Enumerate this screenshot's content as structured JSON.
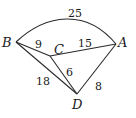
{
  "graph": {
    "nodes": [
      {
        "id": "A",
        "label": "A",
        "x": 116,
        "y": 44,
        "lx": 118,
        "ly": 47
      },
      {
        "id": "B",
        "label": "B",
        "x": 16,
        "y": 42,
        "lx": 2,
        "ly": 47
      },
      {
        "id": "C",
        "label": "C",
        "x": 50,
        "y": 56,
        "lx": 54,
        "ly": 54
      },
      {
        "id": "D",
        "label": "D",
        "x": 77,
        "y": 94,
        "lx": 72,
        "ly": 109
      }
    ],
    "edges": [
      {
        "from": "B",
        "to": "A",
        "weight": "25",
        "curved": true,
        "wx": 68,
        "wy": 17
      },
      {
        "from": "B",
        "to": "C",
        "weight": "9",
        "curved": false,
        "wx": 35,
        "wy": 48
      },
      {
        "from": "C",
        "to": "A",
        "weight": "15",
        "curved": false,
        "wx": 78,
        "wy": 47
      },
      {
        "from": "C",
        "to": "D",
        "weight": "6",
        "curved": false,
        "wx": 66,
        "wy": 76
      },
      {
        "from": "B",
        "to": "D",
        "weight": "18",
        "curved": false,
        "wx": 36,
        "wy": 85
      },
      {
        "from": "D",
        "to": "A",
        "weight": "8",
        "curved": false,
        "wx": 95,
        "wy": 90
      }
    ]
  }
}
